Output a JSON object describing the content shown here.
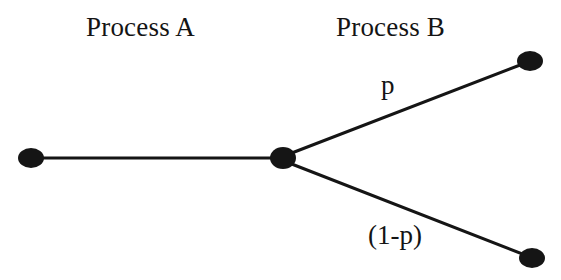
{
  "diagram": {
    "title_labels": {
      "process_a": "Process A",
      "process_b": "Process B"
    },
    "edge_labels": {
      "upper_branch": "p",
      "lower_branch": "(1-p)"
    },
    "colors": {
      "background": "#ffffff",
      "node": "#151515",
      "edge": "#151515",
      "text": "#141414"
    },
    "nodes": [
      {
        "id": "start",
        "name": "start-node",
        "cx": 31,
        "cy": 158,
        "rx": 13,
        "ry": 10
      },
      {
        "id": "junction",
        "name": "junction-node",
        "cx": 283,
        "cy": 158,
        "rx": 13,
        "ry": 11
      },
      {
        "id": "upper-end",
        "name": "upper-end-node",
        "cx": 530,
        "cy": 61,
        "rx": 13,
        "ry": 10
      },
      {
        "id": "lower-end",
        "name": "lower-end-node",
        "cx": 532,
        "cy": 258,
        "rx": 13,
        "ry": 10
      }
    ],
    "edges": [
      {
        "id": "a-edge",
        "name": "process-a-edge",
        "x1": 33,
        "y1": 158,
        "x2": 282,
        "y2": 158,
        "width": 3
      },
      {
        "id": "upper-edge",
        "name": "upper-branch-edge",
        "x1": 284,
        "y1": 156,
        "x2": 528,
        "y2": 62,
        "width": 3
      },
      {
        "id": "lower-edge",
        "name": "lower-branch-edge",
        "x1": 284,
        "y1": 161,
        "x2": 530,
        "y2": 257,
        "width": 3
      }
    ]
  }
}
